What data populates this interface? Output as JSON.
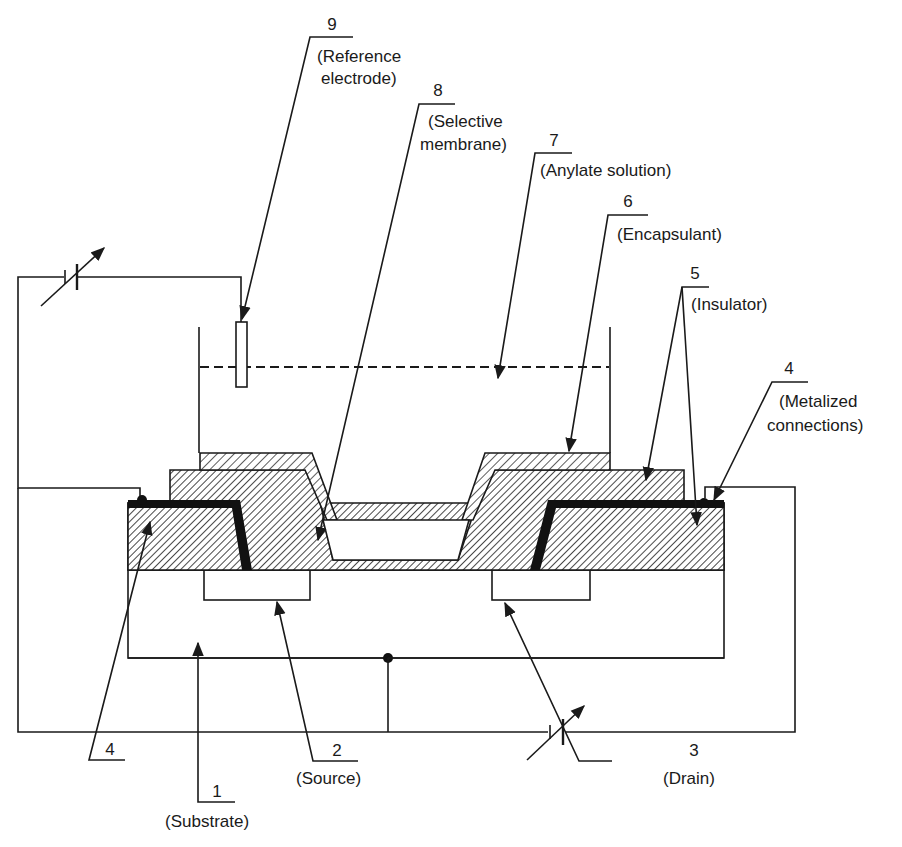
{
  "figure": {
    "type": "ISFET cross-section schematic",
    "colors": {
      "ink": "#1a1a1a",
      "background": "#ffffff"
    }
  },
  "labels": {
    "l1": {
      "number": "1",
      "text": "(Substrate)"
    },
    "l2": {
      "number": "2",
      "text": "(Source)"
    },
    "l3": {
      "number": "3",
      "text": "(Drain)"
    },
    "l4a": {
      "number": "4",
      "text": ""
    },
    "l4b": {
      "number": "4",
      "text_line1": "(Metalized",
      "text_line2": "connections)"
    },
    "l5": {
      "number": "5",
      "text": "(Insulator)"
    },
    "l6": {
      "number": "6",
      "text": "(Encapsulant)"
    },
    "l7": {
      "number": "7",
      "text": "(Anylate solution)"
    },
    "l8": {
      "number": "8",
      "text_line1": "(Selective",
      "text_line2": "membrane)"
    },
    "l9": {
      "number": "9",
      "text_line1": "(Reference",
      "text_line2": "electrode)"
    }
  },
  "components": {
    "gate_voltage_source": "variable-battery-icon",
    "drain_voltage_source": "variable-battery-icon"
  }
}
